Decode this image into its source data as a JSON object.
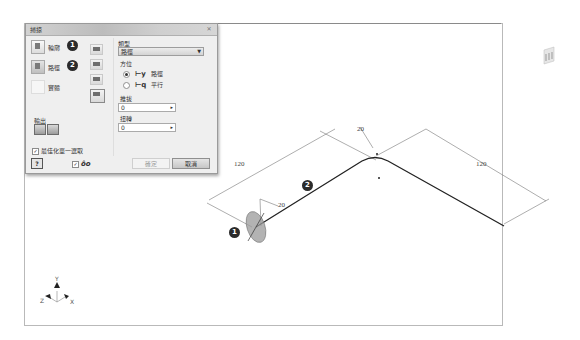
{
  "dialog": {
    "title": "掃掠",
    "close_icon": "close-x-icon",
    "selectors": [
      {
        "label": "輪廓",
        "badge": "1",
        "icon": "profile-select-icon"
      },
      {
        "label": "路徑",
        "badge": "2",
        "icon": "path-select-icon"
      },
      {
        "label": "實體",
        "badge": "",
        "icon": "solid-select-icon"
      }
    ],
    "tools": [
      "join-icon",
      "cut-icon",
      "intersect-icon",
      "new-solid-icon"
    ],
    "output_label": "輸出",
    "output_buttons": [
      "solid-output-icon",
      "surface-output-icon"
    ],
    "optimize_label": "最佳化單一選取",
    "optimize_checked": true,
    "type_label": "類型",
    "type_value": "路徑",
    "orientation_label": "方位",
    "orientation_options": [
      {
        "label": "路徑",
        "selected": true
      },
      {
        "label": "平行",
        "selected": false
      }
    ],
    "taper_label": "推拔",
    "taper_value": "0",
    "twist_label": "扭轉",
    "twist_value": "0",
    "help_label": "?",
    "preview_checked": true,
    "preview_icon": "preview-glasses-icon",
    "preview_glyph": "ôo",
    "ok_label": "確定",
    "cancel_label": "取消"
  },
  "viewport": {
    "dimensions": {
      "left_length": "120",
      "right_length": "120",
      "bend_radius": "20",
      "profile_radius": "20"
    },
    "callouts": [
      "1",
      "2"
    ],
    "axes": {
      "x": "X",
      "y": "Y",
      "z": "Z"
    }
  }
}
